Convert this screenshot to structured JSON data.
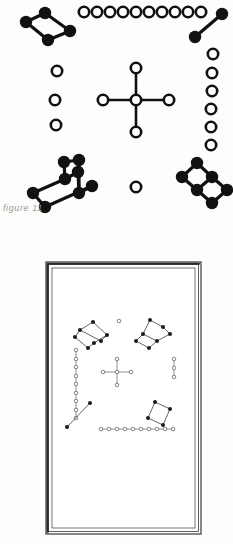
{
  "page": {
    "background_color": "#fdfdfc",
    "ink_color": "#111111",
    "caption_color": "#9a9a96"
  },
  "caption": {
    "text": "figure 11"
  },
  "top_figure": {
    "name": "figure-11-diagram",
    "description": "Molecular-style node diagram with filled and open circles",
    "width": 233,
    "height": 222,
    "node_styles": {
      "filled": {
        "fill": "#111111",
        "stroke": "#111111",
        "radius": 6.2
      },
      "open": {
        "fill": "#ffffff",
        "stroke": "#111111",
        "radius": 5.2,
        "stroke_width": 2.6
      }
    },
    "groups": [
      {
        "name": "top-left-rhombus",
        "style": "filled",
        "nodes": [
          [
            45,
            13
          ],
          [
            26,
            22
          ],
          [
            48,
            40
          ],
          [
            70,
            31
          ]
        ],
        "edges": [
          [
            0,
            1
          ],
          [
            1,
            2
          ],
          [
            2,
            3
          ],
          [
            3,
            0
          ]
        ]
      },
      {
        "name": "top-row-open-chain",
        "style": "open",
        "nodes": [
          [
            84,
            12
          ],
          [
            97,
            12
          ],
          [
            110,
            12
          ],
          [
            123,
            12
          ],
          [
            136,
            12
          ],
          [
            149,
            12
          ],
          [
            162,
            12
          ],
          [
            175,
            12
          ],
          [
            188,
            12
          ],
          [
            201,
            12
          ]
        ],
        "edges": []
      },
      {
        "name": "top-right-segment",
        "style": "filled",
        "nodes": [
          [
            222,
            14
          ],
          [
            195,
            37
          ]
        ],
        "edges": [
          [
            0,
            1
          ]
        ]
      },
      {
        "name": "right-open-column",
        "style": "open",
        "nodes": [
          [
            213,
            54
          ],
          [
            212,
            73
          ],
          [
            212,
            91
          ],
          [
            211,
            109
          ],
          [
            211,
            127
          ],
          [
            211,
            145
          ]
        ],
        "edges": []
      },
      {
        "name": "left-open-column",
        "style": "open",
        "nodes": [
          [
            57,
            71
          ],
          [
            55,
            100
          ],
          [
            56,
            125
          ]
        ],
        "edges": []
      },
      {
        "name": "center-cross",
        "style": "open",
        "nodes": [
          [
            136,
            100
          ],
          [
            136,
            68
          ],
          [
            136,
            132
          ],
          [
            103,
            100
          ],
          [
            169,
            100
          ]
        ],
        "edges": [
          [
            0,
            1
          ],
          [
            0,
            2
          ],
          [
            0,
            3
          ],
          [
            0,
            4
          ]
        ]
      },
      {
        "name": "bottom-left-ladder",
        "style": "filled",
        "nodes": [
          [
            79,
            160
          ],
          [
            65,
            179
          ],
          [
            33,
            193
          ],
          [
            45,
            207
          ],
          [
            79,
            193
          ],
          [
            64,
            162
          ],
          [
            78,
            172
          ],
          [
            92,
            186
          ]
        ],
        "edges": []
      },
      {
        "name": "bottom-right-double-rhombus",
        "style": "filled",
        "nodes": [
          [
            197,
            163
          ],
          [
            182,
            177
          ],
          [
            197,
            190
          ],
          [
            212,
            177
          ],
          [
            212,
            203
          ],
          [
            227,
            190
          ]
        ],
        "edges": []
      },
      {
        "name": "center-lone-open-dot",
        "style": "open",
        "nodes": [
          [
            136,
            187
          ]
        ],
        "edges": []
      }
    ]
  },
  "bottom_figure": {
    "name": "framed-plate-diagram",
    "description": "Same node diagram reproduced inside a double-ruled rectangular frame",
    "frame": {
      "outer": {
        "x": 46,
        "y": 262,
        "width": 155,
        "height": 272
      },
      "inner": {
        "x": 52,
        "y": 268,
        "width": 143,
        "height": 260
      },
      "border_color": "#3a3a3a"
    },
    "node_styles": {
      "filled": {
        "fill": "#1a1a1a",
        "radius": 2.0
      },
      "open": {
        "fill": "#ffffff",
        "stroke": "#555555",
        "radius": 1.8,
        "stroke_width": 0.7
      }
    }
  },
  "meta": {
    "figure_number": "11"
  }
}
